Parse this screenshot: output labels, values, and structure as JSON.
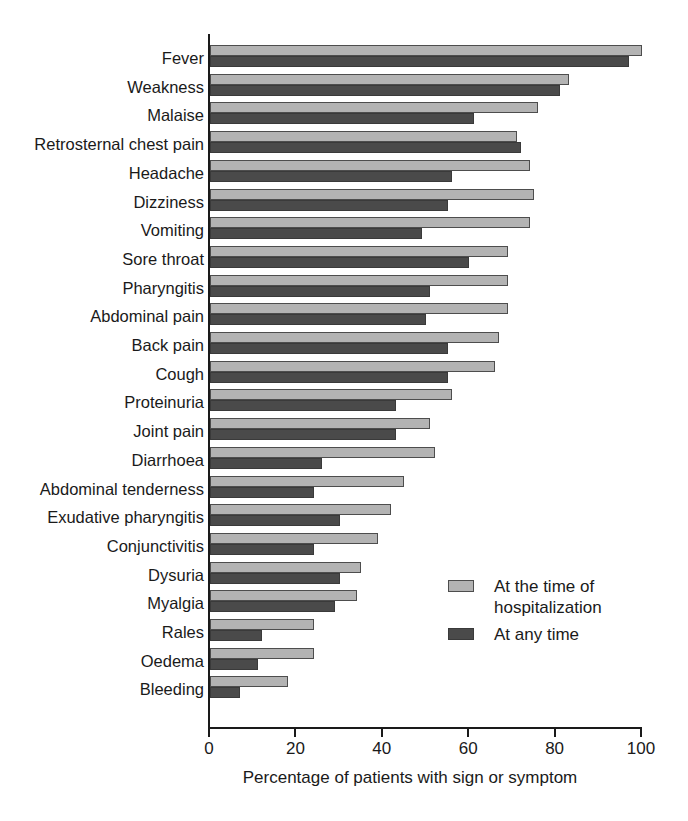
{
  "chart_data": {
    "type": "bar",
    "orientation": "horizontal",
    "title": "",
    "xlabel": "Percentage of patients with sign or symptom",
    "ylabel": "",
    "xlim": [
      0,
      100
    ],
    "xticks": [
      0,
      20,
      40,
      60,
      80,
      100
    ],
    "xtick_labels": [
      "0",
      "20",
      "40",
      "60",
      "80",
      "100"
    ],
    "grid": false,
    "legend_position": "inside-right-lower",
    "categories": [
      "Fever",
      "Weakness",
      "Malaise",
      "Retrosternal chest pain",
      "Headache",
      "Dizziness",
      "Vomiting",
      "Sore throat",
      "Pharyngitis",
      "Abdominal pain",
      "Back pain",
      "Cough",
      "Proteinuria",
      "Joint pain",
      "Diarrhoea",
      "Abdominal tenderness",
      "Exudative pharyngitis",
      "Conjunctivitis",
      "Dysuria",
      "Myalgia",
      "Rales",
      "Oedema",
      "Bleeding"
    ],
    "series": [
      {
        "name": "At the time of hospitalization",
        "color": "#b3b3b3",
        "values": [
          100,
          83,
          76,
          71,
          74,
          75,
          74,
          69,
          69,
          69,
          67,
          66,
          56,
          51,
          52,
          45,
          42,
          39,
          35,
          34,
          24,
          24,
          18
        ]
      },
      {
        "name": "At any time",
        "color": "#4a4a4a",
        "values": [
          97,
          81,
          61,
          72,
          56,
          55,
          49,
          60,
          51,
          50,
          55,
          55,
          43,
          43,
          26,
          24,
          30,
          24,
          30,
          29,
          12,
          11,
          7
        ]
      }
    ]
  },
  "legend": {
    "items": [
      {
        "label": "At the time of hospitalization",
        "swatch": "light"
      },
      {
        "label": "At any time",
        "swatch": "dark"
      }
    ]
  },
  "axis": {
    "x_title": "Percentage of patients with sign or symptom"
  }
}
